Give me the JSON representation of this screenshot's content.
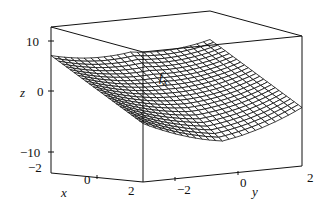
{
  "chart_data": {
    "type": "surface3d",
    "title_main": "f",
    "title_sub": "x",
    "xlabel": "x",
    "ylabel": "y",
    "zlabel": "z",
    "x_ticks": [
      "-2",
      "0",
      "2"
    ],
    "y_ticks": [
      "-2",
      "0",
      "2"
    ],
    "z_ticks": [
      "10",
      "0",
      "-10"
    ],
    "xlim": [
      -2,
      2
    ],
    "ylim": [
      -2,
      2
    ],
    "zlim": [
      -12,
      12
    ],
    "grid": false,
    "legend": null,
    "style": "wireframe mesh",
    "surface_samples": {
      "description": "approximate surface heights read from corners/edges",
      "corners": [
        {
          "x": -2,
          "y": -2,
          "z": 8
        },
        {
          "x": -2,
          "y": 2,
          "z": 11
        },
        {
          "x": 2,
          "y": -2,
          "z": -11
        },
        {
          "x": 2,
          "y": 2,
          "z": -8
        }
      ],
      "back_edge_min": {
        "x": -2,
        "y": 0,
        "z": -1
      }
    }
  },
  "labels": {
    "z_axis": "z",
    "x_axis": "x",
    "y_axis": "y",
    "z_tick_10": "10",
    "z_tick_0": "0",
    "z_tick_m10": "−10",
    "x_tick_m2": "−2",
    "x_tick_0": "0",
    "x_tick_2": "2",
    "y_tick_m2": "−2",
    "y_tick_0": "0",
    "y_tick_2": "2",
    "fn_main": "f",
    "fn_sub": "x"
  },
  "colors": {
    "ink": "#111111",
    "background": "#ffffff"
  }
}
